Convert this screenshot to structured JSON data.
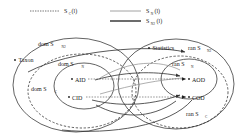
{
  "figure": {
    "type": "set-relation-diagram"
  },
  "legend": {
    "items": [
      {
        "id": "sc",
        "label": "S",
        "sub": "C",
        "arg": "(l)",
        "full": "S_C(l)",
        "style": "dotted",
        "color": "#333333"
      },
      {
        "id": "sn",
        "label": "S",
        "sub": "N",
        "arg": "(l)",
        "full": "S_N(l)",
        "style": "solid-thin",
        "color": "#777777"
      },
      {
        "id": "sn2",
        "label": "S",
        "sub": "N2",
        "arg": "(l)",
        "full": "S_N2(l)",
        "style": "solid-thick",
        "color": "#444444"
      }
    ]
  },
  "regions": [
    {
      "id": "dom-sn2",
      "label": "dom S",
      "sub": "N2",
      "shape": "ellipse",
      "style": "solid",
      "side": "left"
    },
    {
      "id": "dom-sn",
      "label": "dom S",
      "sub": "N",
      "shape": "ellipse",
      "style": "solid",
      "side": "left"
    },
    {
      "id": "dom-sc",
      "label": "dom S",
      "sub": "C",
      "shape": "ellipse",
      "style": "dashed",
      "side": "left"
    },
    {
      "id": "ran-sn2",
      "label": "ran S",
      "sub": "N2",
      "shape": "ellipse",
      "style": "solid",
      "side": "right"
    },
    {
      "id": "ran-sn",
      "label": "ran S",
      "sub": "N",
      "shape": "ellipse",
      "style": "solid",
      "side": "right"
    },
    {
      "id": "ran-sc",
      "label": "ran S",
      "sub": "C",
      "shape": "ellipse",
      "style": "dashed",
      "side": "right"
    }
  ],
  "nodes": [
    {
      "id": "taxon",
      "label": "Taxon",
      "side": "left",
      "x": 21,
      "y": 60
    },
    {
      "id": "aid",
      "label": "AID",
      "side": "left",
      "x": 79,
      "y": 80
    },
    {
      "id": "cid",
      "label": "CID",
      "side": "left",
      "x": 76,
      "y": 98
    },
    {
      "id": "statistics",
      "label": "Statistics",
      "side": "right",
      "x": 161,
      "y": 48
    },
    {
      "id": "aod",
      "label": "AOD",
      "side": "right",
      "x": 196,
      "y": 79
    },
    {
      "id": "cod",
      "label": "COD",
      "side": "right",
      "x": 196,
      "y": 97
    }
  ],
  "edges": [
    {
      "from": "aid",
      "to": "aod",
      "relation": "S_N",
      "style": "dotted"
    },
    {
      "from": "cid",
      "to": "cod",
      "relation": "S_C",
      "style": "dotted"
    },
    {
      "from": "taxon",
      "to": "statistics",
      "relation": "S_N2",
      "style": "solid"
    },
    {
      "from": "aid",
      "to": "aod",
      "relation": "S_N2",
      "style": "solid"
    },
    {
      "from": "cid",
      "to": "cod",
      "relation": "S_N2",
      "style": "solid"
    }
  ],
  "colors": {
    "ink": "#1a1a1a",
    "outline": "#333333",
    "thin": "#888888",
    "dashed": "#2b2b2b"
  }
}
